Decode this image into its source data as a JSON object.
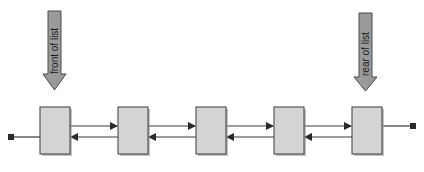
{
  "diagram": {
    "type": "doubly-linked-list",
    "pointers": [
      {
        "id": "front",
        "label": "front of list",
        "target_node": 0
      },
      {
        "id": "rear",
        "label": "rear of list",
        "target_node": 4
      }
    ],
    "nodes": [
      {
        "index": 0
      },
      {
        "index": 1
      },
      {
        "index": 2
      },
      {
        "index": 3
      },
      {
        "index": 4
      }
    ],
    "links": {
      "forward": "next",
      "backward": "prev"
    },
    "terminators": {
      "left": "null (prev of first node)",
      "right": "null (next of last node)"
    },
    "colors": {
      "node_fill": "#d4d4d4",
      "arrow_fill": "#9a9a9a",
      "stroke": "#3a3a3a"
    }
  }
}
